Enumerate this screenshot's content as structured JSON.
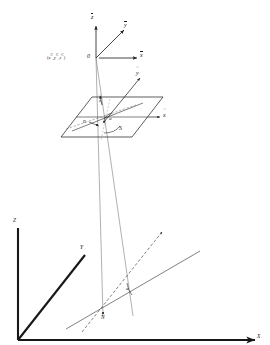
{
  "figure": {
    "ink_color": "#181818",
    "background": "#ffffff"
  },
  "camera_frame": {
    "origin_label": "0",
    "position_label": "(x ,y ,z )",
    "position_superscripts": [
      "C",
      "C",
      "C"
    ],
    "position_base": [
      "x",
      "y",
      "z"
    ],
    "axes": [
      {
        "name": "z-bar-axis",
        "label": "z",
        "decoration": "overbar"
      },
      {
        "name": "y-bar-axis",
        "label": "y",
        "decoration": "overbar"
      },
      {
        "name": "x-bar-axis",
        "label": "x",
        "decoration": "overbar"
      }
    ]
  },
  "image_plane": {
    "name": "image-plane",
    "axes": [
      {
        "name": "y-tilde-axis",
        "label": "y",
        "decoration": "tilde"
      },
      {
        "name": "x-tilde-axis",
        "label": "x",
        "decoration": "tilde"
      },
      {
        "name": "z-tilde-axis",
        "label": "z",
        "decoration": "tilde"
      }
    ],
    "point_n_label": "n",
    "point_s_label": "S",
    "angle_label": "α"
  },
  "world_frame": {
    "axes": [
      {
        "name": "z-axis",
        "label": "Z"
      },
      {
        "name": "y-axis",
        "label": "Y"
      },
      {
        "name": "x-axis",
        "label": "X"
      }
    ],
    "point_n_label": "N",
    "angle_label": "α"
  }
}
